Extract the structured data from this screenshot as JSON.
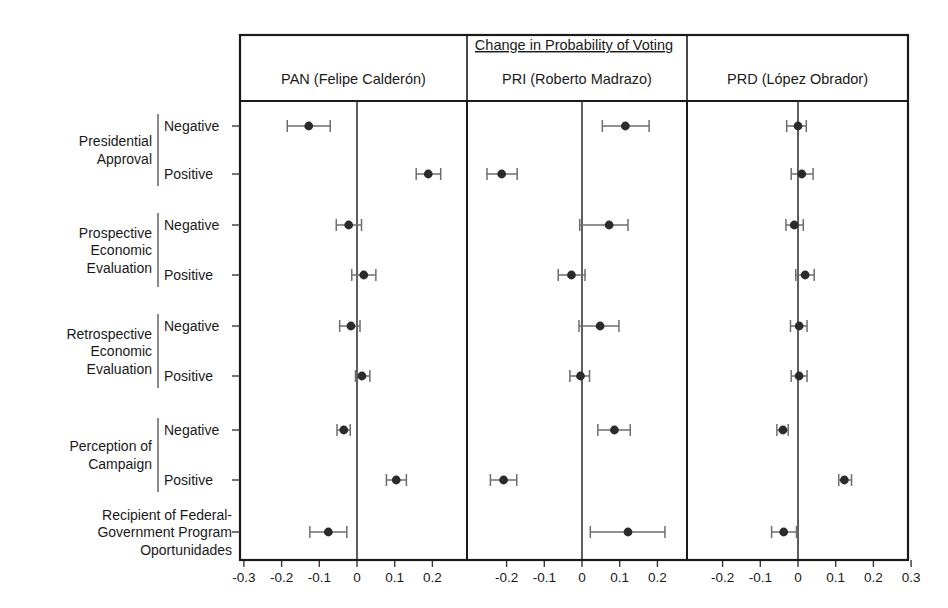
{
  "chart_data": {
    "type": "scatter",
    "title": "Change in Probability of Voting",
    "xlabel": "",
    "ylabel": "",
    "grid": false,
    "legend": "none",
    "panels": [
      {
        "key": "pan",
        "label": "PAN (Felipe Calderón)",
        "xlim": [
          -0.33,
          0.245
        ],
        "ticks": [
          -0.3,
          -0.2,
          -0.1,
          0,
          0.1,
          0.2
        ],
        "ticklabels": [
          "-0.3",
          "-0.2",
          "-0.1",
          "0",
          "0.1",
          "0.2"
        ]
      },
      {
        "key": "pri",
        "label": "PRI (Roberto Madrazo)",
        "xlim": [
          -0.265,
          0.245
        ],
        "ticks": [
          -0.2,
          -0.1,
          0,
          0.1,
          0.2
        ],
        "ticklabels": [
          "-0.2",
          "-0.1",
          "0",
          "0.1",
          "0.2"
        ]
      },
      {
        "key": "prd",
        "label": "PRD (López Obrador)",
        "xlim": [
          -0.245,
          0.325
        ],
        "ticks": [
          -0.2,
          -0.1,
          0,
          0.1,
          0.2,
          0.3
        ],
        "ticklabels": [
          "-0.2",
          "-0.1",
          "0",
          "0.1",
          "0.2",
          "0.3"
        ]
      }
    ],
    "groups": [
      {
        "label": "Presidential\nApproval",
        "rows": [
          "Negative",
          "Positive"
        ]
      },
      {
        "label": "Prospective\nEconomic\nEvaluation",
        "rows": [
          "Negative",
          "Positive"
        ]
      },
      {
        "label": "Retrospective\nEconomic\nEvaluation",
        "rows": [
          "Negative",
          "Positive"
        ]
      },
      {
        "label": "Perception of\nCampaign",
        "rows": [
          "Negative",
          "Positive"
        ]
      },
      {
        "label": "Recipient of Federal-\nGovernment Program\nOportunidades",
        "rows": [
          ""
        ]
      }
    ],
    "rows": [
      {
        "group": "Presidential Approval",
        "level": "Negative",
        "pan": {
          "estimate": -0.128,
          "low": -0.185,
          "high": -0.071
        },
        "pri": {
          "estimate": 0.115,
          "low": 0.054,
          "high": 0.178
        },
        "prd": {
          "estimate": 0.0,
          "low": -0.03,
          "high": 0.022
        }
      },
      {
        "group": "Presidential Approval",
        "level": "Positive",
        "pan": {
          "estimate": 0.189,
          "low": 0.157,
          "high": 0.222
        },
        "pri": {
          "estimate": -0.213,
          "low": -0.252,
          "high": -0.172
        },
        "prd": {
          "estimate": 0.01,
          "low": -0.018,
          "high": 0.04
        }
      },
      {
        "group": "Prospective Economic Evaluation",
        "level": "Negative",
        "pan": {
          "estimate": -0.022,
          "low": -0.055,
          "high": 0.012
        },
        "pri": {
          "estimate": 0.072,
          "low": -0.006,
          "high": 0.122
        },
        "prd": {
          "estimate": -0.01,
          "low": -0.032,
          "high": 0.014
        }
      },
      {
        "group": "Prospective Economic Evaluation",
        "level": "Positive",
        "pan": {
          "estimate": 0.018,
          "low": -0.014,
          "high": 0.05
        },
        "pri": {
          "estimate": -0.028,
          "low": -0.063,
          "high": 0.008
        },
        "prd": {
          "estimate": 0.019,
          "low": -0.006,
          "high": 0.043
        }
      },
      {
        "group": "Retrospective Economic Evaluation",
        "level": "Negative",
        "pan": {
          "estimate": -0.016,
          "low": -0.046,
          "high": 0.008
        },
        "pri": {
          "estimate": 0.048,
          "low": -0.008,
          "high": 0.098
        },
        "prd": {
          "estimate": 0.003,
          "low": -0.02,
          "high": 0.024
        }
      },
      {
        "group": "Retrospective Economic Evaluation",
        "level": "Positive",
        "pan": {
          "estimate": 0.013,
          "low": -0.004,
          "high": 0.034
        },
        "pri": {
          "estimate": -0.004,
          "low": -0.032,
          "high": 0.02
        },
        "prd": {
          "estimate": 0.003,
          "low": -0.018,
          "high": 0.024
        }
      },
      {
        "group": "Perception of Campaign",
        "level": "Negative",
        "pan": {
          "estimate": -0.035,
          "low": -0.053,
          "high": -0.018
        },
        "pri": {
          "estimate": 0.086,
          "low": 0.042,
          "high": 0.128
        },
        "prd": {
          "estimate": -0.04,
          "low": -0.056,
          "high": -0.026
        }
      },
      {
        "group": "Perception of Campaign",
        "level": "Positive",
        "pan": {
          "estimate": 0.104,
          "low": 0.078,
          "high": 0.131
        },
        "pri": {
          "estimate": -0.208,
          "low": -0.243,
          "high": -0.173
        },
        "prd": {
          "estimate": 0.123,
          "low": 0.108,
          "high": 0.142
        }
      },
      {
        "group": "Recipient of Federal-Government Program Oportunidades",
        "level": "",
        "pan": {
          "estimate": -0.076,
          "low": -0.125,
          "high": -0.027
        },
        "pri": {
          "estimate": 0.122,
          "low": 0.022,
          "high": 0.22
        },
        "prd": {
          "estimate": -0.038,
          "low": -0.07,
          "high": -0.004
        }
      }
    ],
    "colors": {
      "point": "#2b2b2b",
      "interval": "#6e6e6e",
      "axis": "#1a1a1a"
    }
  }
}
